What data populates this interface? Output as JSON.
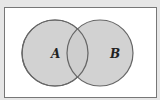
{
  "diagram": {
    "type": "venn",
    "sets": [
      {
        "label": "A"
      },
      {
        "label": "B"
      }
    ],
    "colors": {
      "background": "#e6e6e6",
      "frame_fill": "#ffffff",
      "frame_stroke": "#777777",
      "circle_fill": "#cdcdcd",
      "circle_stroke": "#666666"
    }
  }
}
